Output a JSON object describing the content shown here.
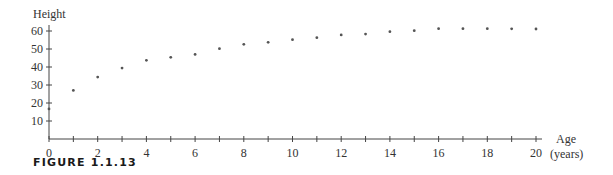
{
  "chart_data": {
    "type": "scatter",
    "title": "",
    "xlabel": "Age",
    "xlabel_unit": "(years)",
    "ylabel": "Height",
    "xlim": [
      0,
      20
    ],
    "ylim": [
      0,
      60
    ],
    "x_ticks": [
      0,
      1,
      2,
      3,
      4,
      5,
      6,
      7,
      8,
      9,
      10,
      11,
      12,
      13,
      14,
      15,
      16,
      17,
      18,
      19,
      20
    ],
    "x_tick_labels": [
      "0",
      "2",
      "4",
      "6",
      "8",
      "10",
      "12",
      "14",
      "16",
      "18",
      "20"
    ],
    "y_ticks": [
      10,
      20,
      30,
      40,
      50,
      60
    ],
    "y_tick_labels": [
      "10",
      "20",
      "30",
      "40",
      "50",
      "60"
    ],
    "grid": false,
    "legend": null,
    "x": [
      0,
      1,
      2,
      3,
      4,
      5,
      6,
      7,
      8,
      9,
      10,
      11,
      12,
      13,
      14,
      15,
      16,
      17,
      18,
      19,
      20
    ],
    "values": [
      16.7,
      27,
      34.4,
      39.4,
      43.7,
      45.4,
      47,
      50.2,
      52.6,
      53.7,
      55.2,
      56.3,
      57.8,
      58.3,
      59.6,
      60.2,
      61.3,
      61.3,
      61.3,
      61.2,
      61.1
    ]
  },
  "caption": "FIGURE 1.1.13"
}
